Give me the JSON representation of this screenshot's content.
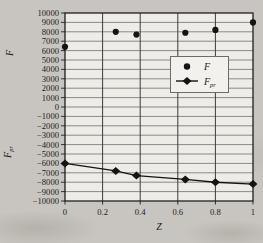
{
  "figure": {
    "bg_color": "#c8c5c0",
    "plot_bg_color": "#edece7",
    "grid_color_h": "#606060",
    "grid_color_v": "#3c3c3c",
    "axis_color": "#1f1f1f",
    "marker_color": "#141414",
    "legend_bg": "#f2f1ed",
    "legend_border": "#6b6b6b"
  },
  "chart_data": {
    "type": "scatter",
    "title": "",
    "xlabel": "Z",
    "ylabel_top": {
      "text": "F",
      "sub": ""
    },
    "ylabel_bottom": {
      "text": "F",
      "sub": "pr"
    },
    "xlim": [
      0,
      1
    ],
    "ylim": [
      -10000,
      10000
    ],
    "x_ticks": [
      "0",
      "0.2",
      "0.4",
      "0.6",
      "0.8",
      "1"
    ],
    "x_tick_values": [
      0,
      0.2,
      0.4,
      0.6,
      0.8,
      1
    ],
    "y_tick_step": 1000,
    "grid": "both",
    "x": [
      0,
      0.27,
      0.38,
      0.64,
      0.8,
      1
    ],
    "series": [
      {
        "name": "F",
        "marker": "circle",
        "connect": false,
        "values": [
          6400,
          8000,
          7700,
          7900,
          8200,
          9000
        ]
      },
      {
        "name": "F_pr",
        "marker": "diamond",
        "connect": true,
        "values": [
          -6000,
          -6800,
          -7300,
          -7700,
          -8000,
          -8200
        ]
      }
    ],
    "legend": {
      "position": "inside-upper-right",
      "entries": [
        {
          "label": "F",
          "sub": "",
          "marker": "circle"
        },
        {
          "label": "F",
          "sub": "pr",
          "marker": "diamond-line"
        }
      ]
    }
  }
}
